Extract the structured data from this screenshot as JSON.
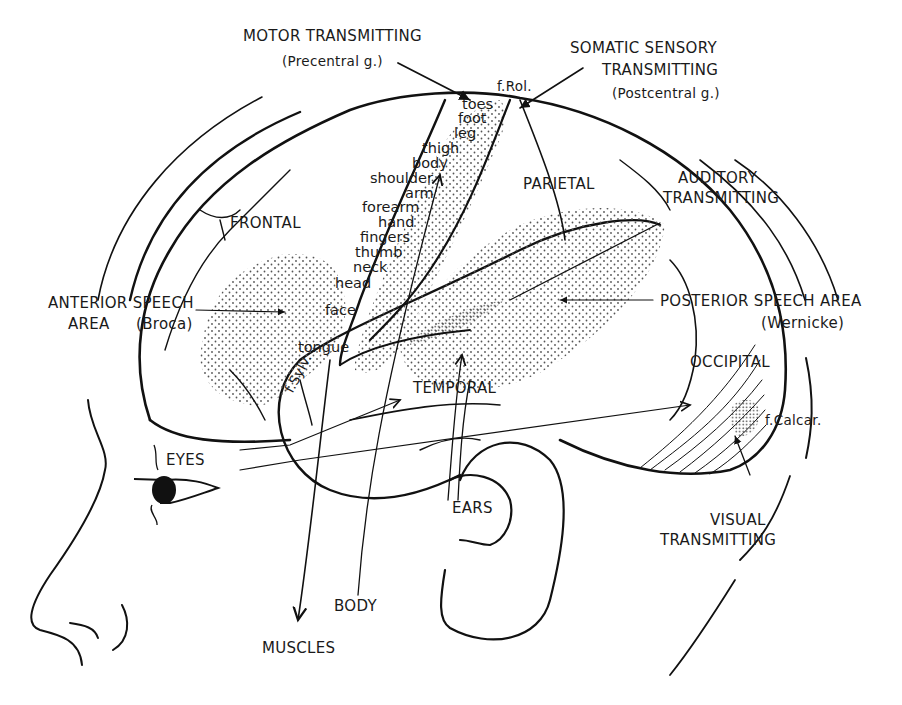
{
  "diagram": {
    "labels": {
      "motor_title": "MOTOR TRANSMITTING",
      "motor_sub": "(Precentral g.)",
      "somatic_title1": "SOMATIC SENSORY",
      "somatic_title2": "TRANSMITTING",
      "somatic_sub": "(Postcentral g.)",
      "frol": "f.Rol.",
      "auditory_title1": "AUDITORY",
      "auditory_title2": "TRANSMITTING",
      "frontal": "FRONTAL",
      "parietal": "PARIETAL",
      "temporal": "TEMPORAL",
      "occipital": "OCCIPITAL",
      "anterior_speech1": "ANTERIOR SPEECH",
      "anterior_speech2": "AREA",
      "broca": "(Broca)",
      "posterior_speech": "POSTERIOR SPEECH AREA",
      "wernicke": "(Wernicke)",
      "fsylv": "f.Sylv.",
      "fcalcar": "f.Calcar.",
      "visual_title1": "VISUAL",
      "visual_title2": "TRANSMITTING",
      "eyes": "EYES",
      "ears": "EARS",
      "body": "BODY",
      "muscles": "MUSCLES"
    },
    "homunculus": [
      "toes",
      "foot",
      "leg",
      "thigh",
      "body",
      "shoulder",
      "arm",
      "forearm",
      "hand",
      "fingers",
      "thumb",
      "neck",
      "head",
      "face",
      "tongue"
    ],
    "colors": {
      "ink": "#111111",
      "background": "#ffffff",
      "stipple": "#555555"
    }
  }
}
